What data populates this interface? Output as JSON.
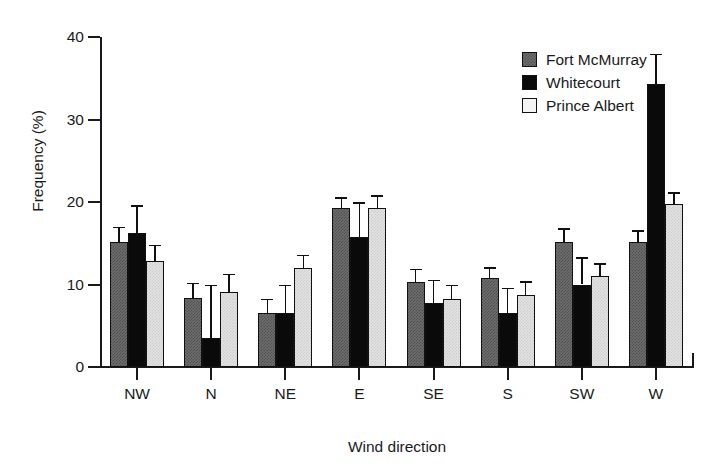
{
  "chart_data": {
    "type": "bar",
    "title": "",
    "xlabel": "Wind direction",
    "ylabel": "Frequency (%)",
    "categories": [
      "NW",
      "N",
      "NE",
      "E",
      "SE",
      "S",
      "SW",
      "W"
    ],
    "ylim": [
      0,
      40
    ],
    "yticks": [
      0,
      10,
      20,
      30,
      40
    ],
    "grid": false,
    "legend_position": "top-right",
    "error_bars": "upper-only",
    "series": [
      {
        "name": "Fort McMurray",
        "color": "#6d6d6d",
        "values": [
          15.2,
          8.4,
          6.6,
          19.3,
          10.3,
          10.8,
          15.1,
          15.1
        ],
        "errors_upper": [
          17.0,
          10.2,
          8.3,
          20.6,
          11.9,
          12.1,
          16.8,
          16.6
        ]
      },
      {
        "name": "Whitecourt",
        "color": "#0a0a0a",
        "values": [
          16.3,
          3.5,
          6.6,
          15.7,
          7.8,
          6.5,
          10.0,
          34.3
        ],
        "errors_upper": [
          19.6,
          10.0,
          10.0,
          20.0,
          10.6,
          9.6,
          13.3,
          38.0
        ]
      },
      {
        "name": "Prince Albert",
        "color": "#e2e2e2",
        "values": [
          12.9,
          9.1,
          12.0,
          19.3,
          8.2,
          8.7,
          11.0,
          19.7
        ],
        "errors_upper": [
          14.8,
          11.3,
          13.6,
          20.8,
          10.0,
          10.4,
          12.6,
          21.2
        ]
      }
    ]
  },
  "legend": {
    "entries": [
      "Fort McMurray",
      "Whitecourt",
      "Prince Albert"
    ]
  }
}
